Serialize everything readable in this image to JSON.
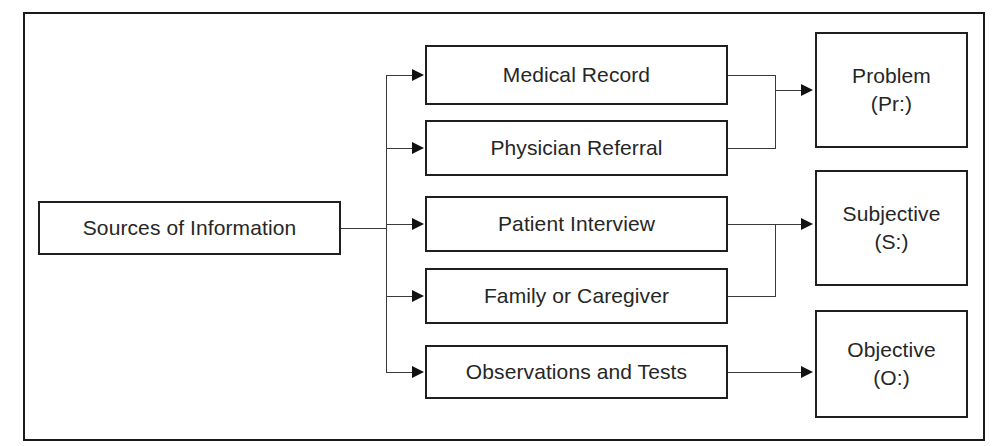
{
  "diagram": {
    "title": "Sources of Information",
    "type": "flowchart",
    "orientation": "left-to-right",
    "frame": {
      "style": "rectangular-border"
    },
    "colors": {
      "background": "#ffffff",
      "box_border": "#1f1f1f",
      "frame_border": "#1a1a1a",
      "connector": "#3a3a3a",
      "arrowhead": "#111111",
      "text": "#262626"
    },
    "source_node": {
      "id": "sources-of-information",
      "label": "Sources of Information"
    },
    "middle_nodes": [
      {
        "id": "medical-record",
        "label": "Medical Record"
      },
      {
        "id": "physician-referral",
        "label": "Physician Referral"
      },
      {
        "id": "patient-interview",
        "label": "Patient Interview"
      },
      {
        "id": "family-or-caregiver",
        "label": "Family or Caregiver"
      },
      {
        "id": "observations-and-tests",
        "label": "Observations and Tests"
      }
    ],
    "output_nodes": [
      {
        "id": "problem",
        "line1": "Problem",
        "line2": "(Pr:)"
      },
      {
        "id": "subjective",
        "line1": "Subjective",
        "line2": "(S:)"
      },
      {
        "id": "objective",
        "line1": "Objective",
        "line2": "(O:)"
      }
    ],
    "edges": [
      {
        "from": "sources-of-information",
        "to": "medical-record"
      },
      {
        "from": "sources-of-information",
        "to": "physician-referral"
      },
      {
        "from": "sources-of-information",
        "to": "patient-interview"
      },
      {
        "from": "sources-of-information",
        "to": "family-or-caregiver"
      },
      {
        "from": "sources-of-information",
        "to": "observations-and-tests"
      },
      {
        "from": "medical-record",
        "to": "problem"
      },
      {
        "from": "physician-referral",
        "to": "problem"
      },
      {
        "from": "patient-interview",
        "to": "subjective"
      },
      {
        "from": "family-or-caregiver",
        "to": "subjective"
      },
      {
        "from": "observations-and-tests",
        "to": "objective"
      }
    ]
  }
}
